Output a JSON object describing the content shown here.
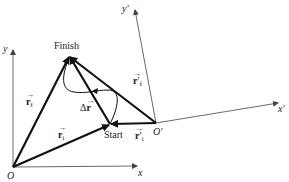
{
  "diagram": {
    "type": "vector displacement diagram with two reference frames",
    "points": {
      "origin": {
        "label": "O",
        "x": 13,
        "y": 167
      },
      "origin_prime": {
        "label": "O′",
        "x": 156,
        "y": 123
      },
      "finish": {
        "label": "Finish",
        "x": 69,
        "y": 56
      },
      "start": {
        "label": "Start",
        "x": 110,
        "y": 124
      }
    },
    "axes": {
      "x": "x",
      "y": "y",
      "x_prime": "x′",
      "y_prime": "y′"
    },
    "vectors": {
      "r_f": {
        "symbol": "r",
        "sub": "f",
        "prime": ""
      },
      "r_i": {
        "symbol": "r",
        "sub": "i",
        "prime": ""
      },
      "r_f_prime": {
        "symbol": "r",
        "sub": "f",
        "prime": "′"
      },
      "r_i_prime": {
        "symbol": "r",
        "sub": "i",
        "prime": "′"
      },
      "delta_r": {
        "prefix": "Δ",
        "symbol": "r"
      }
    },
    "arrow_glyph": "→",
    "colors": {
      "line": "#111111",
      "axis": "#444444",
      "background": "#ffffff"
    }
  }
}
